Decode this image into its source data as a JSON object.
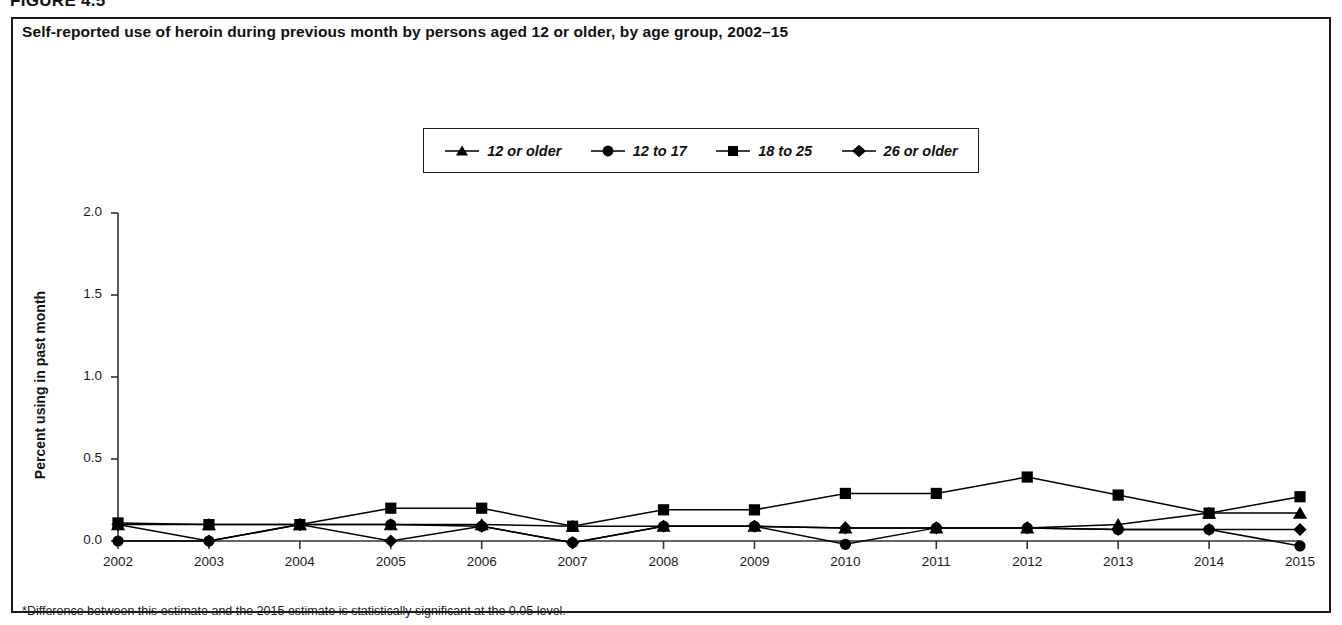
{
  "figure": {
    "label": "FIGURE 4.5",
    "title": "Self-reported use of heroin during previous month by persons aged 12 or older, by age group, 2002–15",
    "footnote_marker": "*",
    "footnote": "Difference between this estimate and the 2015 estimate is statistically significant at the 0.05 level."
  },
  "legend": {
    "position": "top-center",
    "entries": [
      {
        "label": "12 or older",
        "marker": "triangle",
        "color": "#000000"
      },
      {
        "label": "12 to 17",
        "marker": "circle",
        "color": "#000000"
      },
      {
        "label": "18 to 25",
        "marker": "square",
        "color": "#000000"
      },
      {
        "label": "26 or older",
        "marker": "diamond",
        "color": "#000000"
      }
    ]
  },
  "axes": {
    "y_label": "Percent using in past month",
    "y_ticks": [
      "0.0",
      "0.5",
      "1.0",
      "1.5",
      "2.0"
    ],
    "y_tick_values": [
      0.0,
      0.5,
      1.0,
      1.5,
      2.0
    ],
    "x_label": "",
    "x_ticks": [
      "2002",
      "2003",
      "2004",
      "2005",
      "2006",
      "2007",
      "2008",
      "2009",
      "2010",
      "2011",
      "2012",
      "2013",
      "2014",
      "2015"
    ]
  },
  "chart_data": {
    "type": "line",
    "title": "Self-reported use of heroin during previous month by persons aged 12 or older, by age group, 2002–15",
    "xlabel": "",
    "ylabel": "Percent using in past month",
    "ylim": [
      -0.06,
      2.0
    ],
    "xlim": [
      2002,
      2015
    ],
    "grid": false,
    "legend_position": "top-center",
    "categories": [
      "2002",
      "2003",
      "2004",
      "2005",
      "2006",
      "2007",
      "2008",
      "2009",
      "2010",
      "2011",
      "2012",
      "2013",
      "2014",
      "2015"
    ],
    "x": [
      2002,
      2003,
      2004,
      2005,
      2006,
      2007,
      2008,
      2009,
      2010,
      2011,
      2012,
      2013,
      2014,
      2015
    ],
    "series": [
      {
        "name": "12 or older",
        "marker": "triangle",
        "values": [
          0.1,
          0.1,
          0.1,
          0.1,
          0.1,
          0.09,
          0.09,
          0.09,
          0.08,
          0.08,
          0.08,
          0.1,
          0.17,
          0.17
        ]
      },
      {
        "name": "12 to 17",
        "marker": "circle",
        "values": [
          0.0,
          0.0,
          0.1,
          0.1,
          0.09,
          -0.01,
          0.09,
          0.09,
          -0.02,
          0.08,
          0.08,
          0.07,
          0.07,
          -0.03
        ]
      },
      {
        "name": "18 to 25",
        "marker": "square",
        "values": [
          0.11,
          0.1,
          0.1,
          0.2,
          0.2,
          0.09,
          0.19,
          0.19,
          0.29,
          0.29,
          0.39,
          0.28,
          0.17,
          0.27
        ]
      },
      {
        "name": "26 or older",
        "marker": "diamond",
        "values": [
          0.1,
          0.0,
          0.1,
          0.0,
          0.09,
          -0.01,
          0.09,
          0.09,
          0.08,
          0.08,
          0.08,
          0.07,
          0.07,
          0.07
        ]
      }
    ]
  },
  "plot_geometry": {
    "left": 118,
    "right": 1300,
    "top": 213,
    "bottom": 541
  }
}
